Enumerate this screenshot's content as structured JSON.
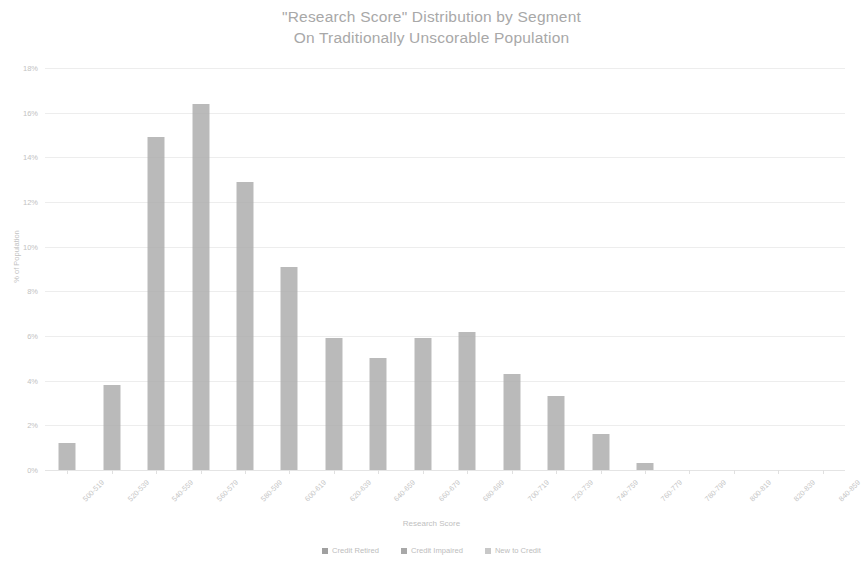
{
  "chart_data": {
    "type": "bar",
    "title": "\"Research Score\" Distribution by Segment",
    "subtitle": "On Traditionally Unscorable Population",
    "xlabel": "Research Score",
    "ylabel": "% of Population",
    "ylim": [
      0,
      18
    ],
    "ytick_labels": [
      "18%",
      "16%",
      "14%",
      "12%",
      "10%",
      "8%",
      "6%",
      "4%",
      "2%",
      "0%"
    ],
    "ytick_values": [
      18,
      16,
      14,
      12,
      10,
      8,
      6,
      4,
      2,
      0
    ],
    "grid": true,
    "legend_position": "bottom",
    "categories": [
      "500-519",
      "520-539",
      "540-559",
      "560-579",
      "580-599",
      "600-619",
      "620-639",
      "640-659",
      "660-679",
      "680-699",
      "700-719",
      "720-739",
      "740-759",
      "760-779",
      "780-799",
      "800-819",
      "820-839",
      "840-859"
    ],
    "values": [
      1.2,
      3.8,
      14.9,
      16.4,
      12.9,
      9.1,
      5.9,
      5.0,
      5.9,
      6.2,
      4.3,
      3.3,
      1.6,
      0.3,
      0.0,
      0.0,
      0.0,
      0.0
    ],
    "series": [
      {
        "name": "Credit Retired",
        "values": [
          1.2,
          3.8,
          14.9,
          16.4,
          12.9,
          9.1,
          5.9,
          5.0,
          5.9,
          6.2,
          4.3,
          3.3,
          1.6,
          0.3,
          0.0,
          0.0,
          0.0,
          0.0
        ]
      }
    ],
    "bar_color": "#a9a9a9"
  },
  "legend": {
    "items": [
      {
        "label": "Credit Retired",
        "color": "#a0a0a0"
      },
      {
        "label": "Credit Impaired",
        "color": "#a8a8a8"
      },
      {
        "label": "New to Credit",
        "color": "#c8c8c8"
      }
    ]
  }
}
